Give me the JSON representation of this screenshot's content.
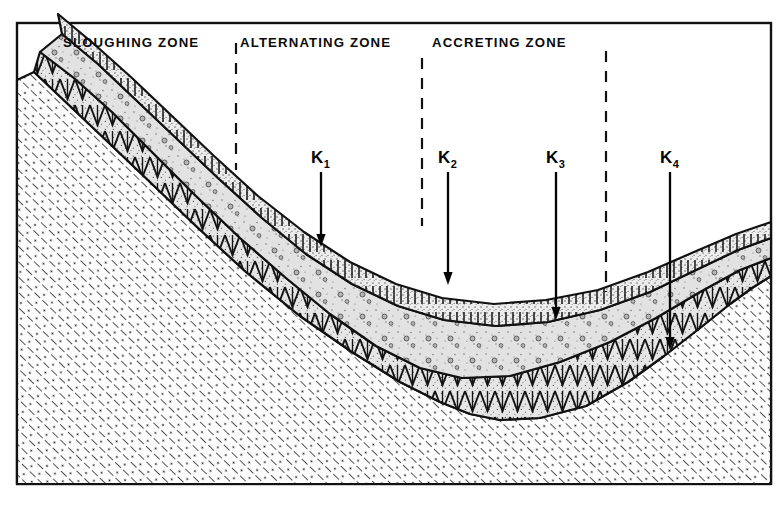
{
  "figure": {
    "kind": "geologic-cross-section",
    "frame": {
      "stroke_color": "#111111",
      "fill_color": "#ffffff",
      "x": 17,
      "y": 23,
      "width": 754,
      "height": 461
    },
    "background_color": "#ffffff",
    "ink_color": "#111111"
  },
  "zones": [
    {
      "id": "sloughing",
      "label": "SLOUGHING   ZONE",
      "label_x": 63,
      "label_y": 47,
      "divider_after": {
        "x": 236,
        "y_top": 43,
        "y_bottom": 170
      }
    },
    {
      "id": "alternating",
      "label": "ALTERNATING  ZONE",
      "label_x": 240,
      "label_y": 47,
      "divider_after": {
        "x": 422,
        "y_top": 58,
        "y_bottom": 226
      }
    },
    {
      "id": "accreting",
      "label": "ACCRETING   ZONE",
      "label_x": 432,
      "label_y": 47,
      "divider_after": {
        "x": 606,
        "y_top": 51,
        "y_bottom": 292
      }
    }
  ],
  "annotations": [
    {
      "id": "k1",
      "base": "K",
      "sub": "1",
      "label_x": 311,
      "label_y": 163,
      "arrow_x": 321,
      "arrow_y_top": 172,
      "arrow_y_tip": 247
    },
    {
      "id": "k2",
      "base": "K",
      "sub": "2",
      "label_x": 438,
      "label_y": 163,
      "arrow_x": 448,
      "arrow_y_top": 172,
      "arrow_y_tip": 285
    },
    {
      "id": "k3",
      "base": "K",
      "sub": "3",
      "label_x": 546,
      "label_y": 163,
      "arrow_x": 556,
      "arrow_y_top": 172,
      "arrow_y_tip": 320
    },
    {
      "id": "k4",
      "base": "K",
      "sub": "4",
      "label_x": 660,
      "label_y": 163,
      "arrow_x": 670,
      "arrow_y_top": 172,
      "arrow_y_tip": 350
    }
  ],
  "strata": [
    {
      "id": "bedrock",
      "name": "bedrock-substrate",
      "pattern": "diagonal-hatch-with-dots",
      "fill": "#fdfdfd",
      "outline": "M 17 484 L 17 80 L 34 72 L 70 106 L 108 142 L 150 182 L 196 226 L 246 272 L 300 316 L 352 352 L 400 382 L 440 402 L 470 414 L 500 420 L 540 418 L 586 406 L 628 382 L 664 356 L 700 328 L 730 304 L 752 288 L 771 276 L 771 484 Z"
    },
    {
      "id": "layer-lower",
      "name": "lower-alluvium-layer",
      "pattern": "stipple-with-comb-teeth",
      "fill": "#e3e3e3",
      "outline": "M 34 72 L 70 106 L 108 142 L 150 182 L 196 226 L 246 272 L 300 316 L 352 352 L 400 382 L 440 402 L 470 414 L 500 420 L 540 418 L 586 406 L 628 382 L 664 356 L 700 328 L 730 304 L 752 288 L 771 276 L 771 258 L 740 270 L 700 292 L 656 318 L 610 342 L 560 362 L 510 376 L 462 378 L 420 368 L 376 346 L 330 314 L 286 278 L 240 238 L 196 196 L 152 152 L 112 112 L 74 78 L 40 52 Z"
    },
    {
      "id": "layer-middle",
      "name": "middle-sand-lens",
      "pattern": "coarse-stipple-with-pebbles",
      "fill": "#dcdcdc",
      "outline": "M 40 52 L 74 78 L 112 112 L 152 152 L 196 196 L 240 238 L 286 278 L 330 314 L 376 346 L 420 368 L 462 378 L 510 376 L 560 362 L 610 342 L 656 318 L 700 292 L 740 270 L 771 258 L 771 238 L 738 250 L 696 270 L 650 292 L 600 310 L 548 322 L 496 326 L 444 320 L 398 306 L 352 284 L 306 254 L 262 218 L 218 178 L 176 138 L 136 100 L 98 64 L 62 34 Z"
    },
    {
      "id": "layer-upper",
      "name": "upper-armour-layer",
      "pattern": "stipple-with-vertical-ticks",
      "fill": "#e8e8e8",
      "outline": "M 62 34 L 98 64 L 136 100 L 176 138 L 218 178 L 262 218 L 306 254 L 352 284 L 398 306 L 444 320 L 496 326 L 548 322 L 600 310 L 650 292 L 696 270 L 738 250 L 771 238 L 771 222 L 736 234 L 694 252 L 648 272 L 598 290 L 546 300 L 494 304 L 442 298 L 396 284 L 350 262 L 304 232 L 258 196 L 214 156 L 172 116 L 132 78 L 94 44 L 58 14 Z"
    }
  ],
  "pattern_legend": [
    {
      "id": "hatch-dots",
      "label": "diagonal hatch with dots",
      "meaning": "bedrock / cohesive bank material"
    },
    {
      "id": "stipple-ticks",
      "label": "stipple with vertical ticks",
      "meaning": "armour / coarse surface layer"
    },
    {
      "id": "stipple-pebbles",
      "label": "coarse stipple with pebbles",
      "meaning": "gravel sand lens"
    },
    {
      "id": "comb-teeth",
      "label": "stipple with chevron teeth",
      "meaning": "alternating deposit"
    }
  ]
}
